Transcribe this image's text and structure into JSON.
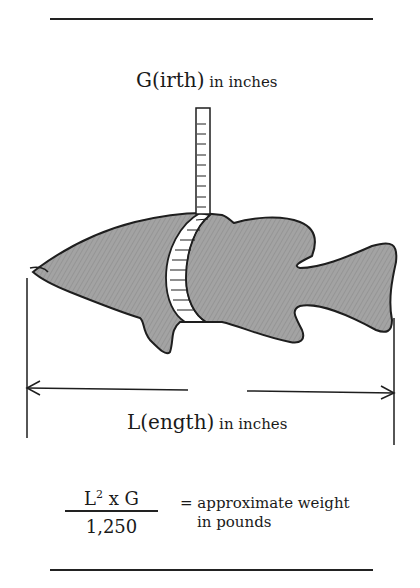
{
  "diagram": {
    "girth_label": {
      "main": "G(irth)",
      "unit": " in inches"
    },
    "length_label": {
      "main": "L(ength)",
      "unit": " in inches"
    },
    "formula": {
      "numerator_base": "L",
      "numerator_exp": "2",
      "numerator_rest": " x G",
      "denominator": "1,250",
      "result_line1": "= approximate weight",
      "result_line2": "in pounds"
    },
    "colors": {
      "ink": "#222222",
      "fish_fill": "#9a9a9a",
      "background": "#ffffff"
    }
  }
}
